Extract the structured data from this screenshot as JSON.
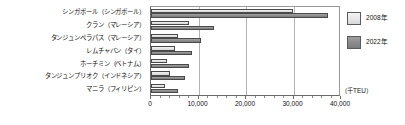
{
  "chart_data": {
    "type": "bar",
    "orientation": "horizontal",
    "title": "",
    "xlabel": "（千TEU）",
    "ylabel": "",
    "xlim": [
      0,
      40000
    ],
    "xticks": [
      0,
      10000,
      20000,
      30000,
      40000
    ],
    "xtick_labels": [
      "0",
      "10,000",
      "20,000",
      "30,000",
      "40,000"
    ],
    "grid": true,
    "grid_axis": "x",
    "legend_position": "right",
    "categories": [
      "シンガポール（シンガポール）",
      "クラン（マレーシア）",
      "タンジュンペラパス（マレーシア）",
      "レムチャバン（タイ）",
      "ホーチミン（ベトナム）",
      "タンジュンプリオク（インドネシア）",
      "マニラ（フィリピン）"
    ],
    "series": [
      {
        "name": "2008年",
        "color": "#e6e6e6",
        "values": [
          29900,
          8000,
          5600,
          5100,
          3400,
          3980,
          2900
        ]
      },
      {
        "name": "2022年",
        "color": "#8b8b8b",
        "values": [
          37300,
          13200,
          10500,
          8700,
          7900,
          7200,
          5600
        ]
      }
    ]
  },
  "axis": {
    "unit_caption": "（千TEU）"
  },
  "legend": {
    "items": [
      {
        "label": "2008年",
        "swatch": "light-gray-swatch"
      },
      {
        "label": "2022年",
        "swatch": "dark-gray-swatch"
      }
    ]
  }
}
